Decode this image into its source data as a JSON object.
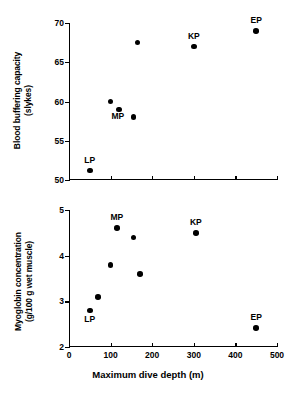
{
  "figure": {
    "background": "#ffffff",
    "marker_color": "#000000",
    "axis_color": "#000000"
  },
  "chart_data": [
    {
      "type": "scatter",
      "panel": "top",
      "title": "",
      "xlabel": "",
      "ylabel": "Blood buffering capacity",
      "ylabel_units": "(slykes)",
      "xlim": [
        0,
        500
      ],
      "ylim": [
        50,
        70
      ],
      "xticks": [
        0,
        100,
        200,
        300,
        400,
        500
      ],
      "xticklabels": [
        "",
        "",
        "",
        "",
        "",
        ""
      ],
      "yticks": [
        50,
        55,
        60,
        65,
        70
      ],
      "yticklabels": [
        "50",
        "55",
        "60",
        "65",
        "70"
      ],
      "grid": false,
      "legend": "none",
      "points": [
        {
          "x": 50,
          "y": 51.2,
          "label": "LP",
          "label_dx": 0,
          "label_dy": -6
        },
        {
          "x": 100,
          "y": 60.0,
          "label": "",
          "label_dx": 0,
          "label_dy": 0
        },
        {
          "x": 120,
          "y": 59.0,
          "label": "MP",
          "label_dx": -1,
          "label_dy": 12
        },
        {
          "x": 155,
          "y": 58.0,
          "label": "",
          "label_dx": 0,
          "label_dy": 0
        },
        {
          "x": 165,
          "y": 67.5,
          "label": "",
          "label_dx": 0,
          "label_dy": 0
        },
        {
          "x": 300,
          "y": 67.0,
          "label": "KP",
          "label_dx": 0,
          "label_dy": -6
        },
        {
          "x": 450,
          "y": 69.0,
          "label": "EP",
          "label_dx": 0,
          "label_dy": -6
        }
      ]
    },
    {
      "type": "scatter",
      "panel": "bottom",
      "title": "",
      "xlabel": "Maximum dive depth (m)",
      "ylabel": "Myoglobin concentration",
      "ylabel_units": "(g/100 g wet muscle)",
      "xlim": [
        0,
        500
      ],
      "ylim": [
        2,
        5
      ],
      "xticks": [
        0,
        100,
        200,
        300,
        400,
        500
      ],
      "xticklabels": [
        "0",
        "100",
        "200",
        "300",
        "400",
        "500"
      ],
      "yticks": [
        2,
        3,
        4,
        5
      ],
      "yticklabels": [
        "2",
        "3",
        "4",
        "5"
      ],
      "grid": false,
      "legend": "none",
      "points": [
        {
          "x": 50,
          "y": 2.8,
          "label": "LP",
          "label_dx": 0,
          "label_dy": 14
        },
        {
          "x": 70,
          "y": 3.1,
          "label": "",
          "label_dx": 0,
          "label_dy": 0
        },
        {
          "x": 100,
          "y": 3.8,
          "label": "",
          "label_dx": 0,
          "label_dy": 0
        },
        {
          "x": 115,
          "y": 4.6,
          "label": "MP",
          "label_dx": 0,
          "label_dy": -6
        },
        {
          "x": 155,
          "y": 4.4,
          "label": "",
          "label_dx": 0,
          "label_dy": 0
        },
        {
          "x": 170,
          "y": 3.6,
          "label": "",
          "label_dx": 0,
          "label_dy": 0
        },
        {
          "x": 305,
          "y": 4.5,
          "label": "KP",
          "label_dx": 0,
          "label_dy": -6
        },
        {
          "x": 450,
          "y": 2.42,
          "label": "EP",
          "label_dx": 0,
          "label_dy": -6
        }
      ]
    }
  ],
  "species_codes": [
    "LP",
    "MP",
    "KP",
    "EP"
  ]
}
